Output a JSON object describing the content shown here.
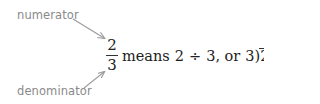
{
  "labels": {
    "numerator": "numerator",
    "denominator": "denominator"
  },
  "fraction": {
    "numerator": "2",
    "denominator": "3"
  },
  "expression": {
    "means": "means",
    "dividend": "2",
    "divide_symbol": "÷",
    "divisor": "3",
    "comma_or": ", or",
    "longdiv_divisor": "3",
    "longdiv_bracket": ")",
    "longdiv_dividend": "2",
    "period": "."
  },
  "colors": {
    "label_gray": "#8a8a8a",
    "arrow_gray": "#9a9a9a",
    "text": "#222222"
  }
}
